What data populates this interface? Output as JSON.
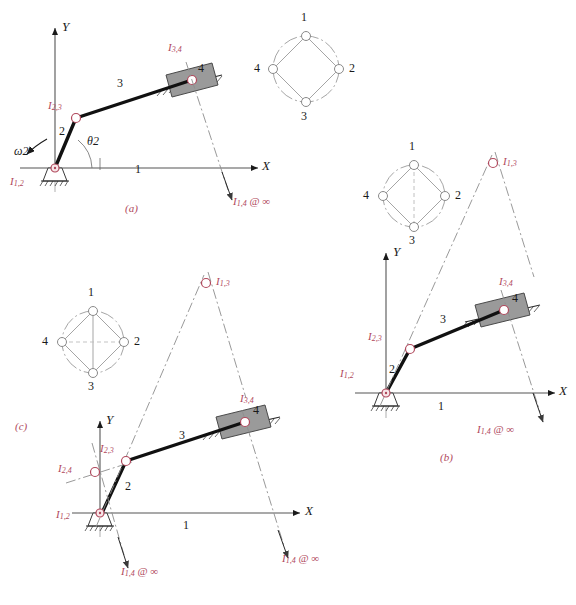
{
  "figure": {
    "colors": {
      "instant_center_label": "#b0485c",
      "link_line": "#111111",
      "slider_fill": "#9a9a9a",
      "slider_stroke": "#4a4a4a",
      "axis": "#555555",
      "construction_line": "#8d8d8d",
      "circle_diagram_line": "#9b9b9b",
      "pivot_fill": "#f7e6e8"
    },
    "panels": [
      {
        "id": "a",
        "caption": "(a)",
        "axes": {
          "x": "X",
          "y": "Y"
        },
        "link_numbers": [
          "1",
          "2",
          "3",
          "4"
        ],
        "angle_label": "θ",
        "angle_sub": "2",
        "omega_label": "ω",
        "omega_sub": "2",
        "instant_centers": [
          {
            "name": "I",
            "sub": "1,2",
            "note": ""
          },
          {
            "name": "I",
            "sub": "2,3",
            "note": ""
          },
          {
            "name": "I",
            "sub": "3,4",
            "note": ""
          },
          {
            "name": "I",
            "sub": "1,4",
            "note": "@ ∞"
          }
        ],
        "circle_diagram": {
          "nodes": [
            "1",
            "2",
            "3",
            "4"
          ],
          "solid_edges": [
            [
              "1",
              "2"
            ],
            [
              "2",
              "3"
            ],
            [
              "3",
              "4"
            ],
            [
              "4",
              "1"
            ]
          ],
          "dashed_edges": []
        }
      },
      {
        "id": "b",
        "caption": "(b)",
        "axes": {
          "x": "X",
          "y": "Y"
        },
        "link_numbers": [
          "1",
          "2",
          "3",
          "4"
        ],
        "instant_centers": [
          {
            "name": "I",
            "sub": "1,2",
            "note": ""
          },
          {
            "name": "I",
            "sub": "2,3",
            "note": ""
          },
          {
            "name": "I",
            "sub": "3,4",
            "note": ""
          },
          {
            "name": "I",
            "sub": "1,3",
            "note": ""
          },
          {
            "name": "I",
            "sub": "1,4",
            "note": "@ ∞"
          }
        ],
        "circle_diagram": {
          "nodes": [
            "1",
            "2",
            "3",
            "4"
          ],
          "solid_edges": [
            [
              "1",
              "2"
            ],
            [
              "2",
              "3"
            ],
            [
              "3",
              "4"
            ],
            [
              "4",
              "1"
            ]
          ],
          "dashed_edges": [
            [
              "1",
              "3"
            ]
          ]
        }
      },
      {
        "id": "c",
        "caption": "(c)",
        "axes": {
          "x": "X",
          "y": "Y"
        },
        "link_numbers": [
          "1",
          "2",
          "3",
          "4"
        ],
        "instant_centers": [
          {
            "name": "I",
            "sub": "1,2",
            "note": ""
          },
          {
            "name": "I",
            "sub": "2,3",
            "note": ""
          },
          {
            "name": "I",
            "sub": "3,4",
            "note": ""
          },
          {
            "name": "I",
            "sub": "1,3",
            "note": ""
          },
          {
            "name": "I",
            "sub": "2,4",
            "note": ""
          },
          {
            "name": "I",
            "sub": "1,4",
            "note": "@ ∞"
          }
        ],
        "circle_diagram": {
          "nodes": [
            "1",
            "2",
            "3",
            "4"
          ],
          "solid_edges": [
            [
              "1",
              "2"
            ],
            [
              "2",
              "3"
            ],
            [
              "3",
              "4"
            ],
            [
              "4",
              "1"
            ],
            [
              "1",
              "3"
            ]
          ],
          "dashed_edges": [
            [
              "2",
              "4"
            ]
          ]
        }
      }
    ],
    "text": {
      "infinity": "∞",
      "at": "@",
      "ground_link_number": "1",
      "crank_link_number": "2",
      "coupler_link_number": "3",
      "slider_link_number": "4"
    }
  }
}
